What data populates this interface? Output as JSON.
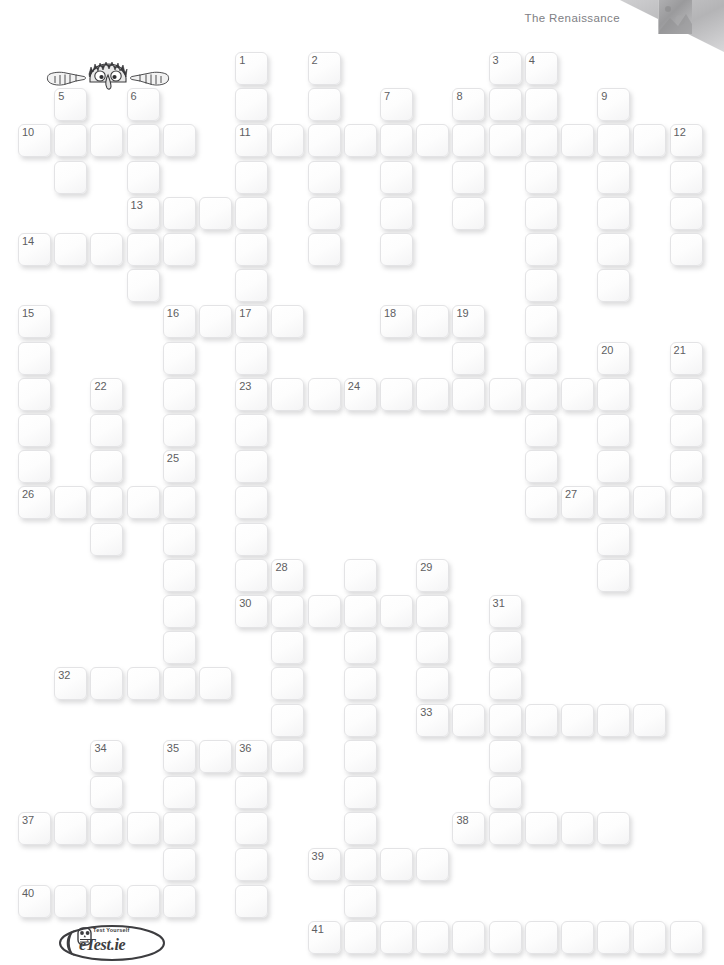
{
  "header": {
    "title": "The Renaissance",
    "corner_fold_color": "#b9b9bb"
  },
  "puzzle": {
    "type": "crossword",
    "grid_origin_x": 18,
    "grid_origin_y": 52,
    "cell_pitch_x": 36.2,
    "cell_pitch_y": 36.2,
    "cell_size": 33,
    "cell_fill_color": "#fdfdfd",
    "cell_border_color": "#e3e3e5",
    "number_color": "#5e5e62",
    "clue_numbers": [
      1,
      2,
      3,
      4,
      5,
      6,
      7,
      8,
      9,
      10,
      11,
      12,
      13,
      14,
      15,
      16,
      17,
      18,
      19,
      20,
      21,
      22,
      23,
      24,
      25,
      26,
      27,
      28,
      29,
      30,
      31,
      32,
      33,
      34,
      35,
      36,
      37,
      38,
      39,
      40,
      41
    ],
    "cells": [
      {
        "c": 6,
        "r": 0,
        "n": "1"
      },
      {
        "c": 8,
        "r": 0,
        "n": "2"
      },
      {
        "c": 13,
        "r": 0,
        "n": "3"
      },
      {
        "c": 14,
        "r": 0,
        "n": "4"
      },
      {
        "c": 6,
        "r": 1
      },
      {
        "c": 8,
        "r": 1
      },
      {
        "c": 10,
        "r": 1,
        "n": "7"
      },
      {
        "c": 12,
        "r": 1,
        "n": "8"
      },
      {
        "c": 13,
        "r": 1
      },
      {
        "c": 14,
        "r": 1
      },
      {
        "c": 16,
        "r": 1,
        "n": "9"
      },
      {
        "c": 1,
        "r": 1,
        "n": "5"
      },
      {
        "c": 3,
        "r": 1,
        "n": "6"
      },
      {
        "c": 0,
        "r": 2,
        "n": "10"
      },
      {
        "c": 1,
        "r": 2
      },
      {
        "c": 2,
        "r": 2
      },
      {
        "c": 3,
        "r": 2
      },
      {
        "c": 4,
        "r": 2
      },
      {
        "c": 6,
        "r": 2,
        "n": "11"
      },
      {
        "c": 7,
        "r": 2
      },
      {
        "c": 8,
        "r": 2
      },
      {
        "c": 9,
        "r": 2
      },
      {
        "c": 10,
        "r": 2
      },
      {
        "c": 11,
        "r": 2
      },
      {
        "c": 12,
        "r": 2
      },
      {
        "c": 13,
        "r": 2
      },
      {
        "c": 14,
        "r": 2
      },
      {
        "c": 15,
        "r": 2
      },
      {
        "c": 16,
        "r": 2
      },
      {
        "c": 17,
        "r": 2
      },
      {
        "c": 18,
        "r": 2,
        "n": "12"
      },
      {
        "c": 1,
        "r": 3
      },
      {
        "c": 3,
        "r": 3
      },
      {
        "c": 6,
        "r": 3
      },
      {
        "c": 8,
        "r": 3
      },
      {
        "c": 10,
        "r": 3
      },
      {
        "c": 12,
        "r": 3
      },
      {
        "c": 14,
        "r": 3
      },
      {
        "c": 16,
        "r": 3
      },
      {
        "c": 18,
        "r": 3
      },
      {
        "c": 3,
        "r": 4,
        "n": "13"
      },
      {
        "c": 4,
        "r": 4
      },
      {
        "c": 5,
        "r": 4
      },
      {
        "c": 6,
        "r": 4
      },
      {
        "c": 8,
        "r": 4
      },
      {
        "c": 10,
        "r": 4
      },
      {
        "c": 12,
        "r": 4
      },
      {
        "c": 14,
        "r": 4
      },
      {
        "c": 16,
        "r": 4
      },
      {
        "c": 18,
        "r": 4
      },
      {
        "c": 0,
        "r": 5,
        "n": "14"
      },
      {
        "c": 1,
        "r": 5
      },
      {
        "c": 2,
        "r": 5
      },
      {
        "c": 3,
        "r": 5
      },
      {
        "c": 4,
        "r": 5
      },
      {
        "c": 6,
        "r": 5
      },
      {
        "c": 8,
        "r": 5
      },
      {
        "c": 10,
        "r": 5
      },
      {
        "c": 14,
        "r": 5
      },
      {
        "c": 16,
        "r": 5
      },
      {
        "c": 18,
        "r": 5
      },
      {
        "c": 3,
        "r": 6
      },
      {
        "c": 6,
        "r": 6
      },
      {
        "c": 14,
        "r": 6
      },
      {
        "c": 16,
        "r": 6
      },
      {
        "c": 0,
        "r": 7,
        "n": "15"
      },
      {
        "c": 4,
        "r": 7,
        "n": "16"
      },
      {
        "c": 5,
        "r": 7
      },
      {
        "c": 6,
        "r": 7,
        "n": "17"
      },
      {
        "c": 7,
        "r": 7
      },
      {
        "c": 10,
        "r": 7,
        "n": "18"
      },
      {
        "c": 11,
        "r": 7
      },
      {
        "c": 12,
        "r": 7,
        "n": "19"
      },
      {
        "c": 14,
        "r": 7
      },
      {
        "c": 0,
        "r": 8
      },
      {
        "c": 4,
        "r": 8
      },
      {
        "c": 6,
        "r": 8
      },
      {
        "c": 12,
        "r": 8
      },
      {
        "c": 14,
        "r": 8
      },
      {
        "c": 16,
        "r": 8,
        "n": "20"
      },
      {
        "c": 18,
        "r": 8,
        "n": "21"
      },
      {
        "c": 0,
        "r": 9
      },
      {
        "c": 2,
        "r": 9,
        "n": "22"
      },
      {
        "c": 4,
        "r": 9
      },
      {
        "c": 6,
        "r": 9,
        "n": "23"
      },
      {
        "c": 7,
        "r": 9
      },
      {
        "c": 8,
        "r": 9
      },
      {
        "c": 9,
        "r": 9,
        "n": "24"
      },
      {
        "c": 10,
        "r": 9
      },
      {
        "c": 11,
        "r": 9
      },
      {
        "c": 12,
        "r": 9
      },
      {
        "c": 13,
        "r": 9
      },
      {
        "c": 14,
        "r": 9
      },
      {
        "c": 15,
        "r": 9
      },
      {
        "c": 16,
        "r": 9
      },
      {
        "c": 18,
        "r": 9
      },
      {
        "c": 0,
        "r": 10
      },
      {
        "c": 2,
        "r": 10
      },
      {
        "c": 4,
        "r": 10
      },
      {
        "c": 6,
        "r": 10
      },
      {
        "c": 14,
        "r": 10
      },
      {
        "c": 16,
        "r": 10
      },
      {
        "c": 18,
        "r": 10
      },
      {
        "c": 0,
        "r": 11
      },
      {
        "c": 2,
        "r": 11
      },
      {
        "c": 4,
        "r": 11,
        "n": "25"
      },
      {
        "c": 6,
        "r": 11
      },
      {
        "c": 14,
        "r": 11
      },
      {
        "c": 16,
        "r": 11
      },
      {
        "c": 18,
        "r": 11
      },
      {
        "c": 0,
        "r": 12,
        "n": "26"
      },
      {
        "c": 1,
        "r": 12
      },
      {
        "c": 2,
        "r": 12
      },
      {
        "c": 3,
        "r": 12
      },
      {
        "c": 4,
        "r": 12
      },
      {
        "c": 6,
        "r": 12
      },
      {
        "c": 14,
        "r": 12
      },
      {
        "c": 15,
        "r": 12,
        "n": "27"
      },
      {
        "c": 16,
        "r": 12
      },
      {
        "c": 17,
        "r": 12
      },
      {
        "c": 18,
        "r": 12
      },
      {
        "c": 2,
        "r": 13
      },
      {
        "c": 4,
        "r": 13
      },
      {
        "c": 6,
        "r": 13
      },
      {
        "c": 16,
        "r": 13
      },
      {
        "c": 4,
        "r": 14
      },
      {
        "c": 6,
        "r": 14
      },
      {
        "c": 7,
        "r": 14,
        "n": "28"
      },
      {
        "c": 9,
        "r": 14
      },
      {
        "c": 11,
        "r": 14,
        "n": "29"
      },
      {
        "c": 16,
        "r": 14
      },
      {
        "c": 4,
        "r": 15
      },
      {
        "c": 6,
        "r": 15,
        "n": "30"
      },
      {
        "c": 7,
        "r": 15
      },
      {
        "c": 8,
        "r": 15
      },
      {
        "c": 9,
        "r": 15
      },
      {
        "c": 10,
        "r": 15
      },
      {
        "c": 11,
        "r": 15
      },
      {
        "c": 13,
        "r": 15,
        "n": "31"
      },
      {
        "c": 4,
        "r": 16
      },
      {
        "c": 7,
        "r": 16
      },
      {
        "c": 9,
        "r": 16
      },
      {
        "c": 11,
        "r": 16
      },
      {
        "c": 13,
        "r": 16
      },
      {
        "c": 1,
        "r": 17,
        "n": "32"
      },
      {
        "c": 2,
        "r": 17
      },
      {
        "c": 3,
        "r": 17
      },
      {
        "c": 4,
        "r": 17
      },
      {
        "c": 5,
        "r": 17
      },
      {
        "c": 7,
        "r": 17
      },
      {
        "c": 9,
        "r": 17
      },
      {
        "c": 11,
        "r": 17
      },
      {
        "c": 13,
        "r": 17
      },
      {
        "c": 7,
        "r": 18
      },
      {
        "c": 9,
        "r": 18
      },
      {
        "c": 11,
        "r": 18,
        "n": "33"
      },
      {
        "c": 12,
        "r": 18
      },
      {
        "c": 13,
        "r": 18
      },
      {
        "c": 14,
        "r": 18
      },
      {
        "c": 15,
        "r": 18
      },
      {
        "c": 16,
        "r": 18
      },
      {
        "c": 17,
        "r": 18
      },
      {
        "c": 2,
        "r": 19,
        "n": "34"
      },
      {
        "c": 4,
        "r": 19,
        "n": "35"
      },
      {
        "c": 5,
        "r": 19
      },
      {
        "c": 6,
        "r": 19,
        "n": "36"
      },
      {
        "c": 7,
        "r": 19
      },
      {
        "c": 9,
        "r": 19
      },
      {
        "c": 13,
        "r": 19
      },
      {
        "c": 2,
        "r": 20
      },
      {
        "c": 4,
        "r": 20
      },
      {
        "c": 6,
        "r": 20
      },
      {
        "c": 9,
        "r": 20
      },
      {
        "c": 13,
        "r": 20
      },
      {
        "c": 0,
        "r": 21,
        "n": "37"
      },
      {
        "c": 1,
        "r": 21
      },
      {
        "c": 2,
        "r": 21
      },
      {
        "c": 3,
        "r": 21
      },
      {
        "c": 4,
        "r": 21
      },
      {
        "c": 6,
        "r": 21
      },
      {
        "c": 9,
        "r": 21
      },
      {
        "c": 12,
        "r": 21,
        "n": "38"
      },
      {
        "c": 13,
        "r": 21
      },
      {
        "c": 14,
        "r": 21
      },
      {
        "c": 15,
        "r": 21
      },
      {
        "c": 16,
        "r": 21
      },
      {
        "c": 4,
        "r": 22
      },
      {
        "c": 6,
        "r": 22
      },
      {
        "c": 8,
        "r": 22,
        "n": "39"
      },
      {
        "c": 9,
        "r": 22
      },
      {
        "c": 10,
        "r": 22
      },
      {
        "c": 11,
        "r": 22
      },
      {
        "c": 0,
        "r": 23,
        "n": "40"
      },
      {
        "c": 1,
        "r": 23
      },
      {
        "c": 2,
        "r": 23
      },
      {
        "c": 3,
        "r": 23
      },
      {
        "c": 4,
        "r": 23
      },
      {
        "c": 6,
        "r": 23
      },
      {
        "c": 9,
        "r": 23
      },
      {
        "c": 8,
        "r": 24,
        "n": "41"
      },
      {
        "c": 9,
        "r": 24
      },
      {
        "c": 10,
        "r": 24
      },
      {
        "c": 11,
        "r": 24
      },
      {
        "c": 12,
        "r": 24
      },
      {
        "c": 13,
        "r": 24
      },
      {
        "c": 14,
        "r": 24
      },
      {
        "c": 15,
        "r": 24
      },
      {
        "c": 16,
        "r": 24
      },
      {
        "c": 17,
        "r": 24
      },
      {
        "c": 18,
        "r": 24
      }
    ]
  },
  "mascot": {
    "name": "peeking-character",
    "description": "cartoon face with spiky hair peeking over grid with two hands"
  },
  "footer": {
    "logo_tagline": "Test Yourself",
    "logo_name": "eTest.ie"
  }
}
